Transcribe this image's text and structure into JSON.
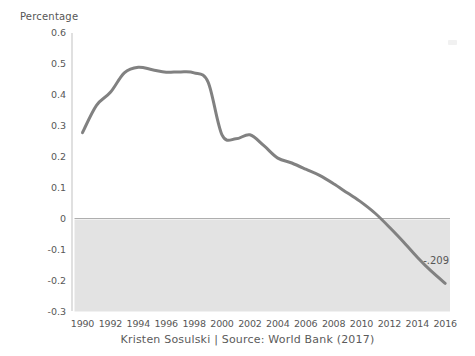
{
  "page": {
    "background": "#ffffff"
  },
  "chart_data": {
    "type": "line",
    "ylabel": "Percentage",
    "caption": "Kristen Sosulski | Source: World Bank (2017)",
    "x": [
      1990,
      1991,
      1992,
      1993,
      1994,
      1995,
      1996,
      1997,
      1998,
      1999,
      2000,
      2001,
      2002,
      2003,
      2004,
      2005,
      2006,
      2007,
      2008,
      2009,
      2010,
      2011,
      2012,
      2013,
      2014,
      2015,
      2016
    ],
    "values": [
      0.277,
      0.365,
      0.407,
      0.47,
      0.488,
      0.48,
      0.472,
      0.473,
      0.47,
      0.44,
      0.27,
      0.257,
      0.27,
      0.235,
      0.195,
      0.179,
      0.159,
      0.139,
      0.112,
      0.082,
      0.052,
      0.016,
      -0.028,
      -0.075,
      -0.125,
      -0.17,
      -0.209
    ],
    "ylim": [
      -0.3,
      0.6
    ],
    "y_ticks": {
      "values": [
        0.6,
        0.5,
        0.4,
        0.3,
        0.2,
        0.1,
        0,
        -0.1,
        -0.2,
        -0.3
      ],
      "labels": [
        "0.6",
        "0.5",
        "0.4",
        "0.3",
        "0.2",
        "0.1",
        "0",
        "-0.1",
        "-0.2",
        "-0.3"
      ]
    },
    "x_ticks": [
      "1990",
      "1992",
      "1994",
      "1996",
      "1998",
      "2000",
      "2002",
      "2004",
      "2006",
      "2008",
      "2010",
      "2012",
      "2014",
      "2016"
    ],
    "end_value_label": "-.209",
    "grid": "off",
    "legend": "none",
    "shaded_region": {
      "from": -0.3,
      "to": 0
    },
    "colors": {
      "line": "#818181",
      "shade_fill": "#e3e3e3",
      "zero_line": "#aeaeae",
      "axis_line": "#cbcbcb",
      "text": "#575757"
    }
  }
}
